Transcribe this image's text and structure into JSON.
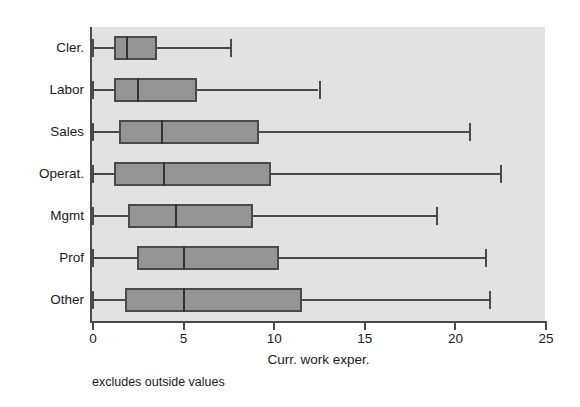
{
  "chart_data": {
    "type": "box",
    "title": "",
    "xlabel": "Curr. work exper.",
    "ylabel": "",
    "footnote": "excludes outside values",
    "orientation": "horizontal",
    "xlim": [
      0,
      26.2
    ],
    "xticks": [
      0,
      5,
      10,
      15,
      20,
      25
    ],
    "xticklabels": [
      "0",
      "5",
      "10",
      "15",
      "20",
      "25"
    ],
    "grid": false,
    "legend": null,
    "categories": [
      "Cler.",
      "Labor",
      "Sales",
      "Operat.",
      "Mgmt",
      "Prof",
      "Other"
    ],
    "boxes": [
      {
        "category": "Cler.",
        "lower_whisker": 0.0,
        "q1": 1.2,
        "median": 1.9,
        "q3": 3.6,
        "upper_whisker": 7.6
      },
      {
        "category": "Labor",
        "lower_whisker": 0.0,
        "q1": 1.2,
        "median": 2.5,
        "q3": 5.8,
        "upper_whisker": 12.5
      },
      {
        "category": "Sales",
        "lower_whisker": 0.0,
        "q1": 1.5,
        "median": 3.8,
        "q3": 9.2,
        "upper_whisker": 20.8
      },
      {
        "category": "Operat.",
        "lower_whisker": 0.0,
        "q1": 1.2,
        "median": 3.9,
        "q3": 9.9,
        "upper_whisker": 22.5
      },
      {
        "category": "Mgmt",
        "lower_whisker": 0.0,
        "q1": 2.0,
        "median": 4.6,
        "q3": 8.9,
        "upper_whisker": 19.0
      },
      {
        "category": "Prof",
        "lower_whisker": 0.0,
        "q1": 2.5,
        "median": 5.0,
        "q3": 10.3,
        "upper_whisker": 21.7
      },
      {
        "category": "Other",
        "lower_whisker": 0.0,
        "q1": 1.8,
        "median": 5.0,
        "q3": 11.6,
        "upper_whisker": 21.9
      }
    ],
    "colors": {
      "plot_background": "#e2e2e2",
      "page_background": "#ffffff",
      "box_fill": "#949494",
      "box_edge": "#4a4a4a",
      "median_line": "#333333",
      "whisker": "#4a4a4a",
      "axis": "#4a4a4a",
      "text": "#1a1a1a"
    }
  }
}
